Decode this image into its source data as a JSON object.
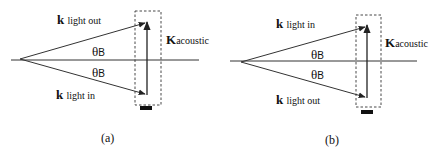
{
  "panels": [
    {
      "id": "a",
      "caption": "(a)",
      "upper_vector": {
        "symbol": "k",
        "subscript": "light out"
      },
      "lower_vector": {
        "symbol": "k",
        "subscript": "light in"
      },
      "acoustic_vector": {
        "symbol": "K",
        "subscript": "acoustic"
      },
      "angle_upper": {
        "symbol": "θ",
        "subscript": "B"
      },
      "angle_lower": {
        "symbol": "θ",
        "subscript": "B"
      }
    },
    {
      "id": "b",
      "caption": "(b)",
      "upper_vector": {
        "symbol": "k",
        "subscript": "light in"
      },
      "lower_vector": {
        "symbol": "k",
        "subscript": "light out"
      },
      "acoustic_vector": {
        "symbol": "K",
        "subscript": "acoustic"
      },
      "angle_upper": {
        "symbol": "θ",
        "subscript": "B"
      },
      "angle_lower": {
        "symbol": "θ",
        "subscript": "B"
      }
    }
  ],
  "colors": {
    "line": "#222222",
    "background": "#ffffff"
  }
}
